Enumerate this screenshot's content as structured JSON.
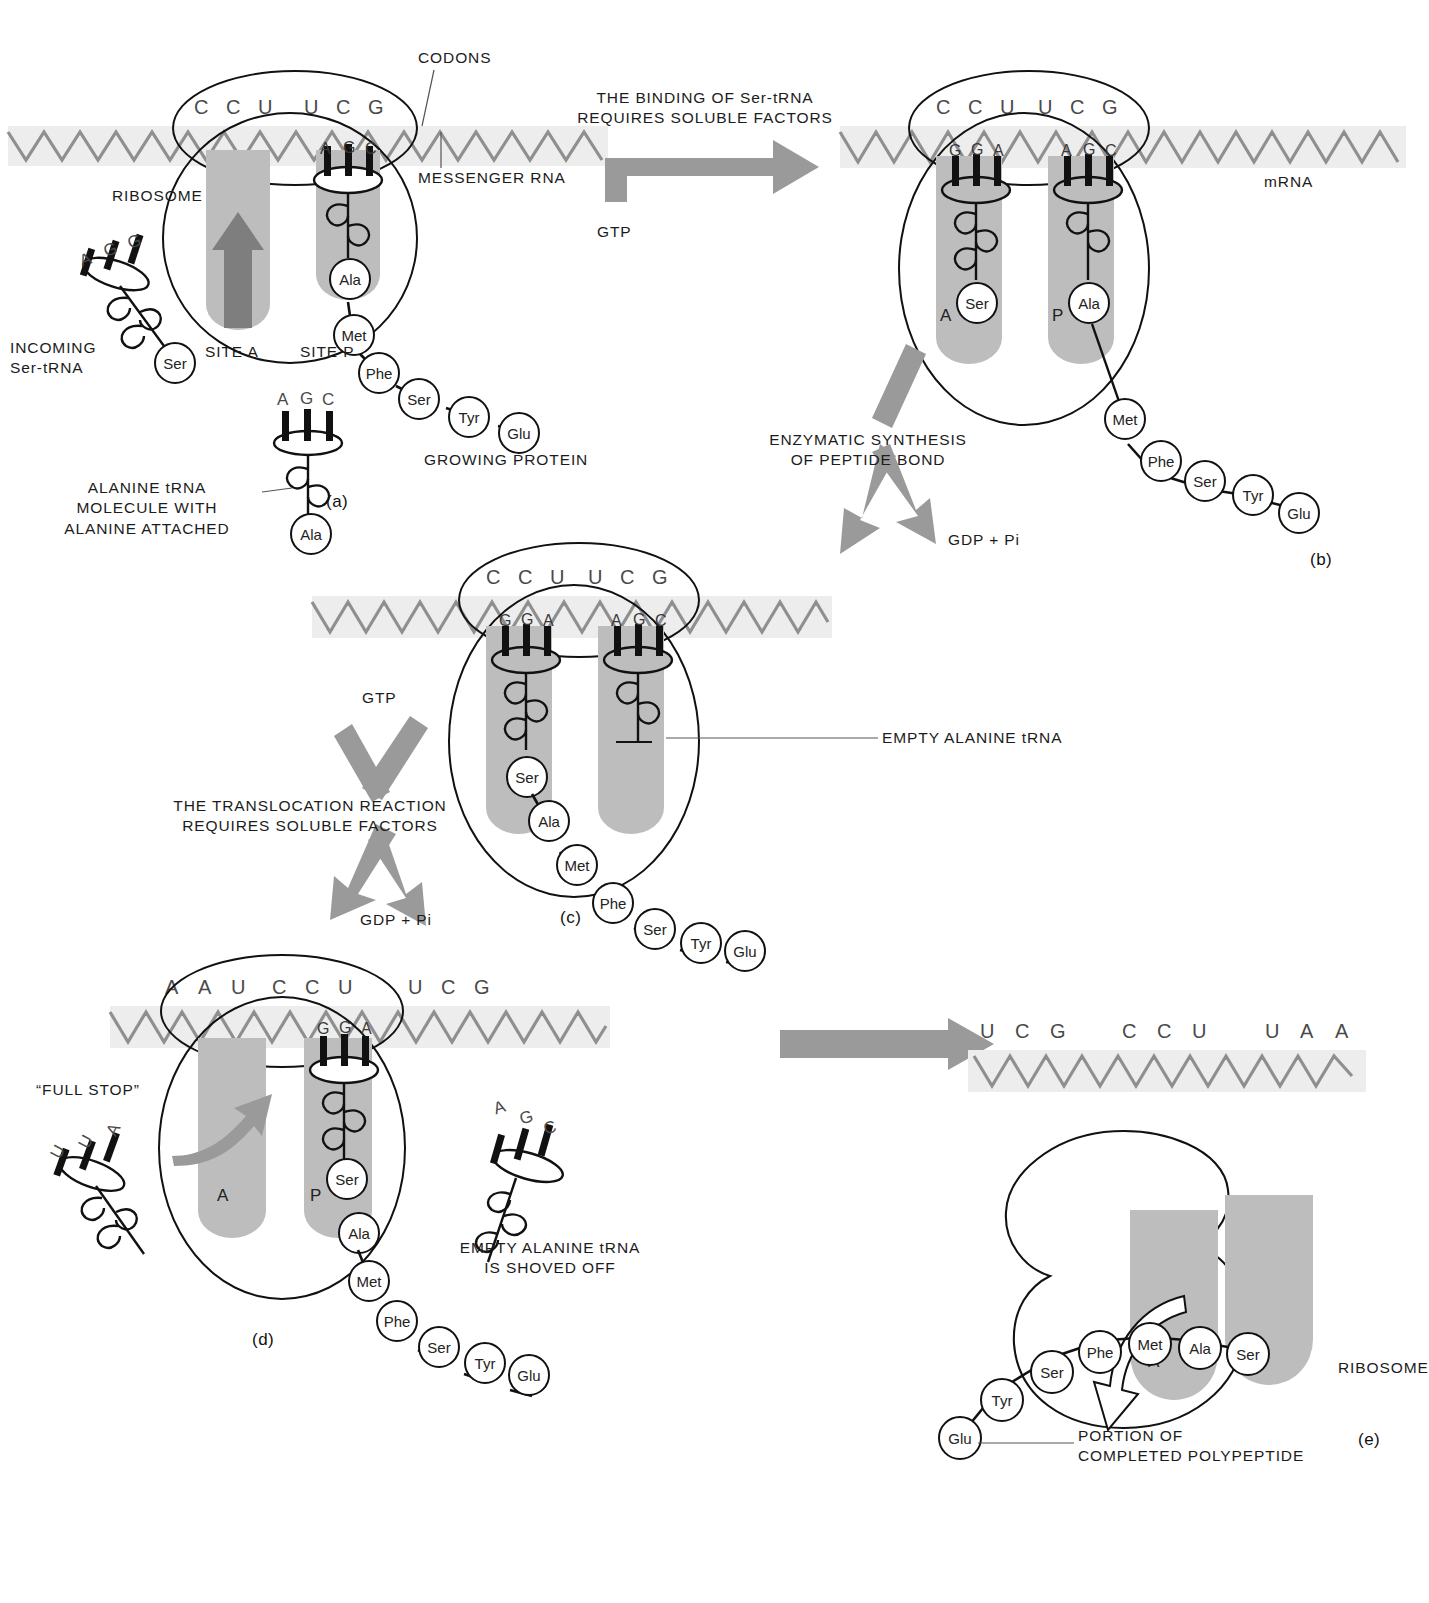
{
  "figure": {
    "title_visible": false,
    "type": "protein-synthesis-translation-diagram",
    "panels": [
      "(a)",
      "(b)",
      "(c)",
      "(d)",
      "(e)"
    ]
  },
  "colors": {
    "ink": "#111111",
    "mrna_strip": "#ededed",
    "mrna_zigzag": "#8f8f8f",
    "pocket_gray": "#bdbdbd",
    "arrow_gray": "#9a9a9a",
    "dark_arrow": "#6f6f6f",
    "base_letter": "#4a4a4a"
  },
  "panel_a": {
    "label": "(a)",
    "mrna_codons": [
      "C",
      "C",
      "U",
      "U",
      "C",
      "G"
    ],
    "p_site_anticodon": [
      "A",
      "G",
      "C"
    ],
    "callouts": {
      "codons": "CODONS",
      "messenger_rna": "MESSENGER RNA",
      "ribosome": "RIBOSOME",
      "site_a": "SITE A",
      "site_p": "SITE P",
      "incoming": "INCOMING\nSer-tRNA",
      "growing_protein": "GROWING PROTEIN",
      "alanine_trna": "ALANINE tRNA\nMOLECULE WITH\nALANINE ATTACHED"
    },
    "incoming_trna": {
      "anticodon": [
        "A",
        "G",
        "G"
      ],
      "amino_acid": "Ser"
    },
    "free_alanine_trna": {
      "anticodon": [
        "A",
        "G",
        "C"
      ],
      "amino_acid": "Ala"
    },
    "p_site_amino_acid": "Ala",
    "peptide_chain": [
      "Met",
      "Phe",
      "Ser",
      "Tyr",
      "Glu"
    ]
  },
  "arrow_ab": {
    "caption": "THE BINDING OF Ser-tRNA\nREQUIRES SOLUBLE FACTORS",
    "input": "GTP"
  },
  "panel_b": {
    "label": "(b)",
    "mrna_codons": [
      "C",
      "C",
      "U",
      "U",
      "C",
      "G"
    ],
    "a_site_anticodon": [
      "G",
      "G",
      "A"
    ],
    "p_site_anticodon": [
      "A",
      "G",
      "C"
    ],
    "a_site_letter": "A",
    "p_site_letter": "P",
    "a_site_amino_acid": "Ser",
    "p_site_amino_acid": "Ala",
    "mrna_label": "mRNA",
    "peptide_chain": [
      "Met",
      "Phe",
      "Ser",
      "Tyr",
      "Glu"
    ]
  },
  "arrow_bc": {
    "caption": "ENZYMATIC SYNTHESIS\nOF PEPTIDE BOND",
    "output": "GDP + Pi"
  },
  "panel_c": {
    "label": "(c)",
    "mrna_codons": [
      "C",
      "C",
      "U",
      "U",
      "C",
      "G"
    ],
    "a_site_anticodon": [
      "G",
      "G",
      "A"
    ],
    "p_site_anticodon": [
      "A",
      "G",
      "C"
    ],
    "a_site_amino_acid": "Ser",
    "callout_empty_trna": "EMPTY ALANINE tRNA",
    "peptide_chain": [
      "Ala",
      "Met",
      "Phe",
      "Ser",
      "Tyr",
      "Glu"
    ]
  },
  "arrow_cd": {
    "input": "GTP",
    "caption": "THE TRANSLOCATION REACTION\nREQUIRES SOLUBLE FACTORS",
    "output": "GDP + Pi"
  },
  "panel_d": {
    "label": "(d)",
    "mrna_codons_left": [
      "A",
      "A",
      "U"
    ],
    "mrna_codons_mid": [
      "C",
      "C",
      "U"
    ],
    "mrna_codons_right": [
      "U",
      "C",
      "G"
    ],
    "p_site_anticodon": [
      "G",
      "G",
      "A"
    ],
    "a_site_letter": "A",
    "p_site_letter": "P",
    "full_stop_label": "“FULL STOP”",
    "full_stop_trna_anticodon": [
      "U",
      "U",
      "A"
    ],
    "p_site_amino_acid": "Ser",
    "next_amino_acid": "Ala",
    "empty_trna_anticodon": [
      "A",
      "G",
      "C"
    ],
    "callout_empty": "EMPTY ALANINE tRNA\nIS SHOVED OFF",
    "peptide_chain": [
      "Met",
      "Phe",
      "Ser",
      "Tyr",
      "Glu"
    ]
  },
  "panel_e": {
    "label": "(e)",
    "mrna_codons_left": [
      "U",
      "C",
      "G"
    ],
    "mrna_codons_mid": [
      "C",
      "C",
      "U"
    ],
    "mrna_codons_right": [
      "U",
      "A",
      "A"
    ],
    "a_site_letter": "A",
    "p_site_letter": "P",
    "ribosome_label": "RIBOSOME",
    "callout_polypeptide": "PORTION OF\nCOMPLETED POLYPEPTIDE",
    "polypeptide_chain": [
      "Glu",
      "Tyr",
      "Ser",
      "Phe",
      "Met",
      "Ala",
      "Ser"
    ]
  }
}
